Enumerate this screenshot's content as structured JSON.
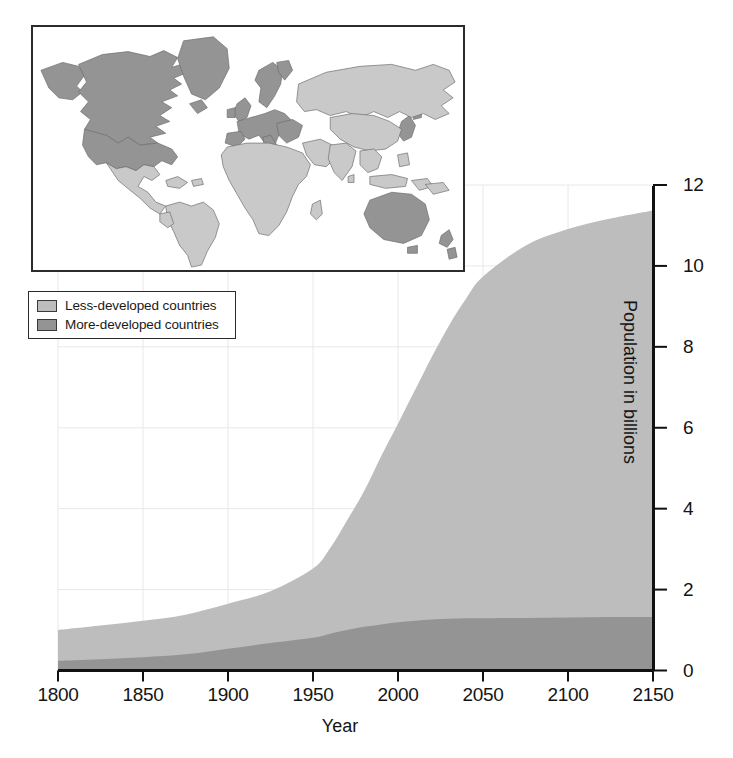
{
  "figure": {
    "background_color": "#ffffff",
    "axis_color": "#1a1a1a"
  },
  "legend": {
    "position": "upper-left",
    "items": [
      {
        "label": "Less-developed countries",
        "color": "#bdbdbd",
        "name": "less-developed"
      },
      {
        "label": "More-developed countries",
        "color": "#949494",
        "name": "more-developed"
      }
    ]
  },
  "map_inset": {
    "name": "world-map-inset",
    "title": "",
    "land_more_developed_color": "#949494",
    "land_less_developed_color": "#c9c9c9",
    "ocean_color": "#ffffff",
    "border_color": "#2b2b2b",
    "regions_more_developed": [
      "North America",
      "Europe",
      "Russia",
      "Japan",
      "Australia",
      "New Zealand",
      "Greenland"
    ],
    "regions_less_developed": [
      "Latin America",
      "Africa",
      "Asia",
      "Middle East",
      "Southeast Asia"
    ]
  },
  "chart_data": {
    "type": "area",
    "title": "",
    "subtitle": "",
    "xlabel": "Year",
    "ylabel": "Population in billions",
    "xlim": [
      1800,
      2150
    ],
    "ylim": [
      0,
      12
    ],
    "xticks": [
      1800,
      1850,
      1900,
      1950,
      2000,
      2050,
      2100,
      2150
    ],
    "xticklabels": [
      "1800",
      "1850",
      "1900",
      "1950",
      "2000",
      "2050",
      "2100",
      "2150"
    ],
    "yticks": [
      0,
      2,
      4,
      6,
      8,
      10,
      12
    ],
    "yticklabels": [
      "0",
      "2",
      "4",
      "6",
      "8",
      "10",
      "12"
    ],
    "y_axis_side": "right",
    "grid": true,
    "grid_color": "#e6e6e6",
    "stacked": true,
    "x": [
      1800,
      1825,
      1850,
      1875,
      1900,
      1925,
      1950,
      1960,
      1970,
      1980,
      1990,
      2000,
      2010,
      2020,
      2030,
      2040,
      2050,
      2075,
      2100,
      2125,
      2150
    ],
    "series": [
      {
        "name": "More-developed countries",
        "color": "#949494",
        "values": [
          0.24,
          0.28,
          0.33,
          0.4,
          0.54,
          0.68,
          0.81,
          0.91,
          1.0,
          1.08,
          1.14,
          1.19,
          1.23,
          1.26,
          1.28,
          1.29,
          1.29,
          1.3,
          1.31,
          1.32,
          1.32
        ]
      },
      {
        "name": "Less-developed countries",
        "color": "#bdbdbd",
        "values": [
          0.76,
          0.83,
          0.9,
          0.98,
          1.11,
          1.28,
          1.71,
          2.11,
          2.71,
          3.35,
          4.15,
          4.91,
          5.7,
          6.5,
          7.25,
          7.9,
          8.45,
          9.2,
          9.6,
          9.85,
          10.05
        ]
      }
    ],
    "totals": [
      1.0,
      1.11,
      1.23,
      1.38,
      1.65,
      1.96,
      2.52,
      3.02,
      3.71,
      4.43,
      5.29,
      6.1,
      6.93,
      7.76,
      8.53,
      9.19,
      9.74,
      10.5,
      10.91,
      11.17,
      11.37
    ],
    "annotations": []
  }
}
